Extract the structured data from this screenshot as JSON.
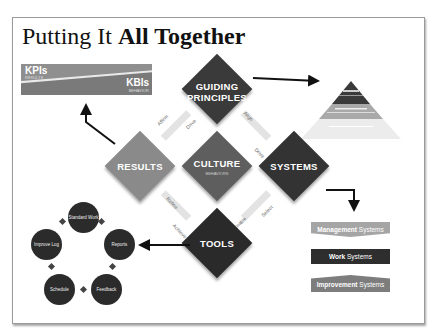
{
  "slide": {
    "title_regular": "Putting It ",
    "title_bold": "All Together"
  },
  "kpi_bar": {
    "kpi_label": "KPIs",
    "kpi_sub": "RESULTS",
    "kbi_label": "KBIs",
    "kbi_sub": "BEHAVIOR"
  },
  "diamonds": {
    "guiding_principles": {
      "line1": "GUIDING",
      "line2": "PRINCIPLES",
      "color": "#3a3a3a"
    },
    "results": {
      "label": "RESULTS",
      "color": "#8a8a8a"
    },
    "culture": {
      "label": "CULTURE",
      "sub": "BEHAVIORS",
      "color": "#5e5e5e"
    },
    "systems": {
      "label": "SYSTEMS",
      "color": "#333333"
    },
    "tools": {
      "label": "TOOLS",
      "color": "#2a2a2a"
    }
  },
  "connectors": {
    "affirm": "Affirm",
    "drive_top": "Drive",
    "align": "Align",
    "drive_right": "Drive",
    "refine": "Refine",
    "achieve": "Achieve",
    "enable": "Enable",
    "select": "Select"
  },
  "pyramid": {
    "tiers": [
      {
        "color": "#3a3a3a"
      },
      {
        "color": "#a9a9a9"
      },
      {
        "color": "#ececec"
      }
    ]
  },
  "systems_stack": [
    {
      "bold": "Management",
      "rest": " Systems",
      "color": "#a5a5a5"
    },
    {
      "bold": "Work",
      "rest": " Systems",
      "color": "#2e2e2e"
    },
    {
      "bold": "Improvement",
      "rest": " Systems",
      "color": "#7d7d7d"
    }
  ],
  "tool_cycle": [
    {
      "label": "Standard Work"
    },
    {
      "label": "Reports"
    },
    {
      "label": "Feedback"
    },
    {
      "label": "Schedule"
    },
    {
      "label": "Improve Log"
    }
  ]
}
